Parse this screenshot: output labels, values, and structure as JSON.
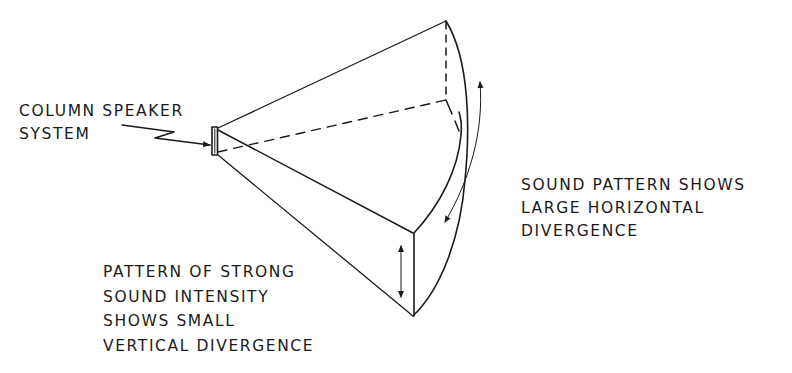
{
  "diagram": {
    "colors": {
      "background": "#ffffff",
      "ink": "#1a1a1a"
    },
    "labels": {
      "speaker": {
        "lines": [
          "COLUMN SPEAKER",
          "SYSTEM"
        ]
      },
      "horizontal": {
        "lines": [
          "SOUND PATTERN SHOWS",
          "LARGE HORIZONTAL",
          "DIVERGENCE"
        ]
      },
      "vertical": {
        "lines": [
          "PATTERN OF STRONG",
          "SOUND INTENSITY",
          "SHOWS SMALL",
          "VERTICAL DIVERGENCE"
        ]
      }
    },
    "elements": [
      {
        "id": "speaker",
        "type": "rectangle",
        "desc": "column speaker source"
      },
      {
        "id": "pointer-arrow",
        "type": "zigzag-arrow",
        "from": "speaker-label",
        "to": "speaker"
      },
      {
        "id": "cone-upper-edge",
        "type": "line",
        "style": "solid"
      },
      {
        "id": "cone-middle-edge",
        "type": "line",
        "style": "solid"
      },
      {
        "id": "cone-hidden-edge",
        "type": "line",
        "style": "dashed"
      },
      {
        "id": "cone-lower-edge",
        "type": "line",
        "style": "solid"
      },
      {
        "id": "back-vertical-edge",
        "type": "line",
        "style": "dashed"
      },
      {
        "id": "front-vertical-edge",
        "type": "line",
        "style": "solid"
      },
      {
        "id": "outer-arc",
        "type": "arc",
        "style": "solid"
      },
      {
        "id": "inner-arc",
        "type": "arc",
        "style": "solid"
      },
      {
        "id": "horizontal-divergence-arrow",
        "type": "double-headed-curved-arrow"
      },
      {
        "id": "vertical-divergence-arrow",
        "type": "double-headed-arrow"
      }
    ]
  }
}
